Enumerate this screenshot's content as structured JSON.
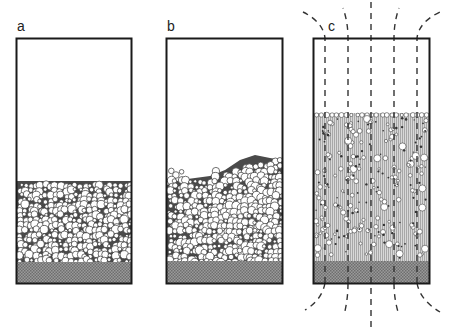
{
  "figure": {
    "panels": [
      {
        "id": "a",
        "label": "a",
        "state": "packed bed"
      },
      {
        "id": "b",
        "label": "b",
        "state": "bubbling / disturbed bed"
      },
      {
        "id": "c",
        "label": "c",
        "state": "expanded bed with field lines"
      }
    ],
    "colors": {
      "border": "#1a1a1a",
      "base": "#8a8a8a",
      "bed_gap": "#4a4a4a",
      "particle_fill": "#ffffff",
      "particle_stroke": "#333333",
      "expanded_bed": "#c8c8c8",
      "field_line": "#333333"
    }
  }
}
